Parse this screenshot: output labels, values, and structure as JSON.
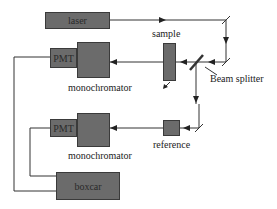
{
  "diagram": {
    "components": {
      "laser": "laser",
      "sample": "sample",
      "beam_splitter": "Beam splitter",
      "pmt_top": "PMT",
      "monochromator_top": "monochromator",
      "pmt_bottom": "PMT",
      "monochromator_bottom": "monochromator",
      "reference": "reference",
      "boxcar": "boxcar"
    },
    "colors": {
      "box_fill": "#6b6b6b",
      "line": "#333333",
      "background": "#ffffff"
    }
  }
}
